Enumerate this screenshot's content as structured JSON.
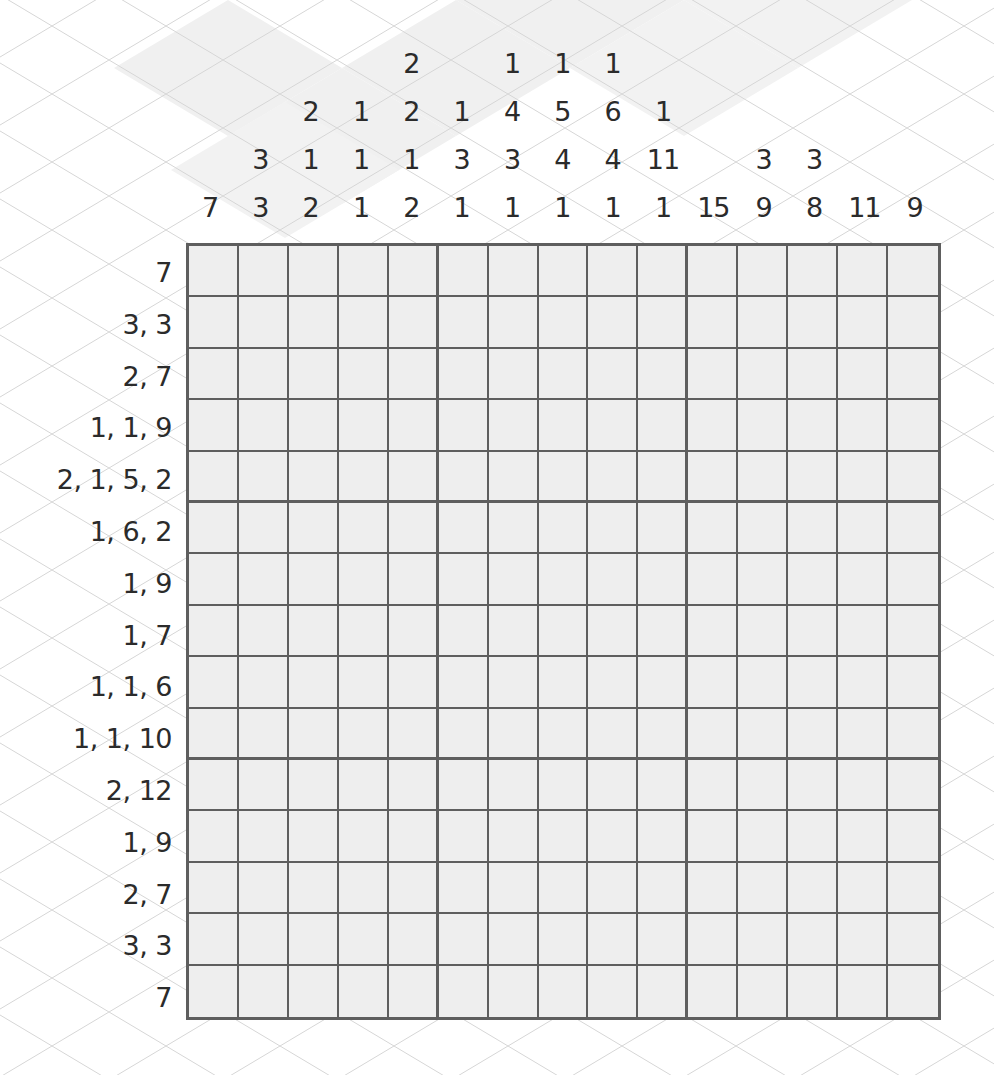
{
  "puzzle": {
    "type": "nonogram",
    "size": {
      "rows": 15,
      "cols": 15
    },
    "column_clues": [
      [
        "7"
      ],
      [
        "3",
        "3"
      ],
      [
        "2",
        "1",
        "2"
      ],
      [
        "1",
        "1",
        "1"
      ],
      [
        "2",
        "2",
        "1",
        "2"
      ],
      [
        "1",
        "3",
        "1"
      ],
      [
        "1",
        "4",
        "3",
        "1"
      ],
      [
        "1",
        "5",
        "4",
        "1"
      ],
      [
        "1",
        "6",
        "4",
        "1"
      ],
      [
        "1",
        "11",
        "1"
      ],
      [
        "15"
      ],
      [
        "3",
        "9"
      ],
      [
        "3",
        "8"
      ],
      [
        "11"
      ],
      [
        "9"
      ]
    ],
    "row_clues": [
      "7",
      "3, 3",
      "2, 7",
      "1, 1, 9",
      "2, 1, 5, 2",
      "1, 6, 2",
      "1, 9",
      "1, 7",
      "1, 1, 6",
      "1, 1, 10",
      "2, 12",
      "1, 9",
      "2, 7",
      "3, 3",
      "7"
    ],
    "cells_filled": []
  },
  "colors": {
    "grid_line": "#5e5e5e",
    "cell_fill": "#eeeeee",
    "clue_text": "#2b2b2b",
    "background": "#ffffff",
    "lattice_line": "#d6d6d6",
    "lattice_shade": "#efefef"
  }
}
